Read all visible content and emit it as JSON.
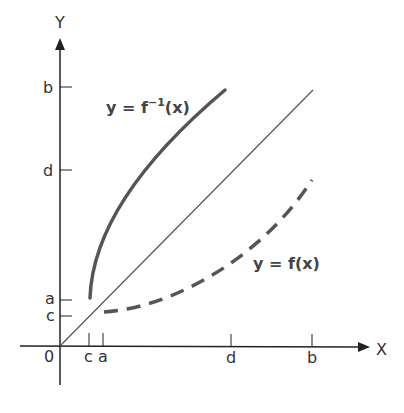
{
  "diagram": {
    "axes": {
      "x_label": "X",
      "y_label": "Y",
      "origin_label": "0"
    },
    "x_ticks": [
      {
        "label": "c",
        "x": 89
      },
      {
        "label": "a",
        "x": 103
      },
      {
        "label": "d",
        "x": 231
      },
      {
        "label": "b",
        "x": 312
      }
    ],
    "y_ticks": [
      {
        "label": "b",
        "y": 87
      },
      {
        "label": "d",
        "y": 170
      },
      {
        "label": "a",
        "y": 300
      },
      {
        "label": "c",
        "y": 316
      }
    ],
    "curves": {
      "inverse_label": "y = f",
      "inverse_sup": "−1",
      "inverse_tail": "(x)",
      "function_label": "y = f(x)",
      "identity": "y = x"
    },
    "colors": {
      "axis": "#222222",
      "curve": "#555555"
    }
  }
}
